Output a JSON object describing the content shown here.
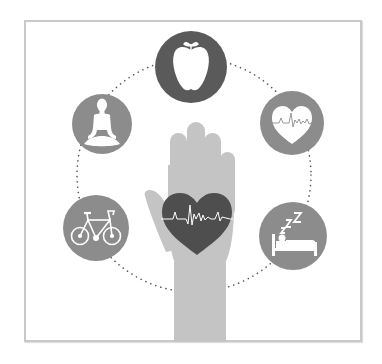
{
  "illustration": {
    "title": "Health and wellness",
    "colors": {
      "background": "#ffffff",
      "frame_border": "#c9c9c9",
      "circle_dark": "#5a5a5a",
      "circle_mid": "#8c8c8c",
      "hand": "#c4c4c4",
      "heart": "#4e4e4e",
      "icon_fill": "#ffffff",
      "dots": "#555555"
    },
    "center": {
      "label": "Hand holding heart with heartbeat line",
      "icons": [
        "hand-icon",
        "heart-icon",
        "heartbeat-line-icon"
      ]
    },
    "ring": {
      "style": "dotted circle connecting icons"
    },
    "circles": [
      {
        "id": "nutrition",
        "label": "Apple (nutrition)",
        "icon": "apple-icon"
      },
      {
        "id": "cardio",
        "label": "Heart with heartbeat (heart health)",
        "icon": "heartbeat-icon"
      },
      {
        "id": "sleep",
        "label": "Person sleeping in bed with Zzz (sleep)",
        "icon": "sleep-bed-icon",
        "text": "zZZ"
      },
      {
        "id": "exercise",
        "label": "Bicycle (exercise)",
        "icon": "bicycle-icon"
      },
      {
        "id": "meditation",
        "label": "Meditating person (mindfulness)",
        "icon": "meditation-icon"
      }
    ]
  }
}
